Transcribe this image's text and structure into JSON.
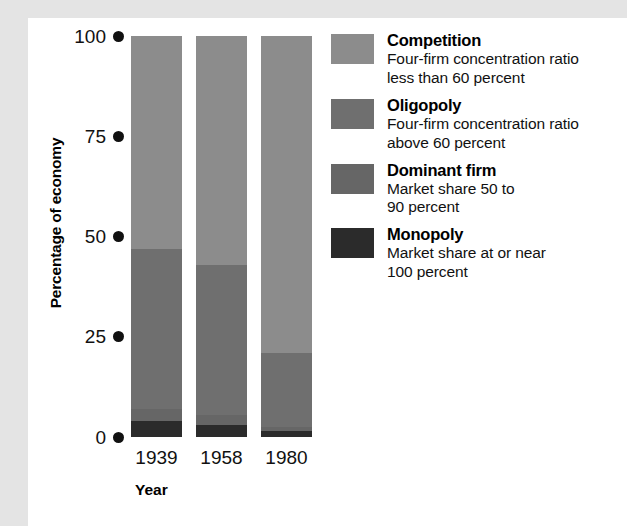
{
  "chart_data": {
    "type": "bar",
    "subtype": "stacked-bar-100-percent",
    "title": "",
    "xlabel": "Year",
    "ylabel": "Percentage of economy",
    "categories": [
      "1939",
      "1958",
      "1980"
    ],
    "ylim": [
      0,
      100
    ],
    "yticks": [
      0,
      25,
      50,
      75,
      100
    ],
    "ytick_labels": [
      "0",
      "25",
      "50",
      "75",
      "100"
    ],
    "grid": false,
    "legend_position": "right",
    "series": [
      {
        "name": "Competition",
        "description": "Four-firm concentration ratio less than 60 percent",
        "color": "#8c8c8c",
        "values": [
          53,
          57,
          79
        ]
      },
      {
        "name": "Oligopoly",
        "description": "Four-firm concentration ratio above 60 percent",
        "color": "#6f6f6f",
        "values": [
          40,
          37.5,
          18.5
        ]
      },
      {
        "name": "Dominant firm",
        "description": "Market share 50 to 90 percent",
        "color": "#666666",
        "values": [
          3,
          2.5,
          1
        ]
      },
      {
        "name": "Monopoly",
        "description": "Market share at or near 100 percent",
        "color": "#2b2b2b",
        "values": [
          4,
          3,
          1.5
        ]
      }
    ]
  },
  "axes": {
    "ylabel": "Percentage of economy",
    "xlabel": "Year",
    "yticks": [
      {
        "label": "100",
        "value": 100
      },
      {
        "label": "75",
        "value": 75
      },
      {
        "label": "50",
        "value": 50
      },
      {
        "label": "25",
        "value": 25
      },
      {
        "label": "0",
        "value": 0
      }
    ],
    "xticks": [
      "1939",
      "1958",
      "1980"
    ]
  },
  "legend": {
    "entries": [
      {
        "label": "Competition",
        "desc_line1": "Four-firm concentration ratio",
        "desc_line2": "less than 60 percent",
        "color": "#8c8c8c"
      },
      {
        "label": "Oligopoly",
        "desc_line1": "Four-firm concentration ratio",
        "desc_line2": "above 60 percent",
        "color": "#6f6f6f"
      },
      {
        "label": "Dominant firm",
        "desc_line1": "Market share 50 to",
        "desc_line2": "90 percent",
        "color": "#666666"
      },
      {
        "label": "Monopoly",
        "desc_line1": "Market share at or near",
        "desc_line2": "100 percent",
        "color": "#2b2b2b"
      }
    ]
  },
  "bars": [
    {
      "year": "1939",
      "segments": [
        {
          "name": "Competition",
          "percent": 53,
          "color": "#8c8c8c"
        },
        {
          "name": "Oligopoly",
          "percent": 40,
          "color": "#6f6f6f"
        },
        {
          "name": "Dominant firm",
          "percent": 3,
          "color": "#666666"
        },
        {
          "name": "Monopoly",
          "percent": 4,
          "color": "#2b2b2b"
        }
      ]
    },
    {
      "year": "1958",
      "segments": [
        {
          "name": "Competition",
          "percent": 57,
          "color": "#8c8c8c"
        },
        {
          "name": "Oligopoly",
          "percent": 37.5,
          "color": "#6f6f6f"
        },
        {
          "name": "Dominant firm",
          "percent": 2.5,
          "color": "#666666"
        },
        {
          "name": "Monopoly",
          "percent": 3,
          "color": "#2b2b2b"
        }
      ]
    },
    {
      "year": "1980",
      "segments": [
        {
          "name": "Competition",
          "percent": 79,
          "color": "#8c8c8c"
        },
        {
          "name": "Oligopoly",
          "percent": 18.5,
          "color": "#6f6f6f"
        },
        {
          "name": "Dominant firm",
          "percent": 1,
          "color": "#666666"
        },
        {
          "name": "Monopoly",
          "percent": 1.5,
          "color": "#2b2b2b"
        }
      ]
    }
  ],
  "colors": {
    "background": "#e4e4e4",
    "card": "#ffffff",
    "text": "#111111"
  }
}
